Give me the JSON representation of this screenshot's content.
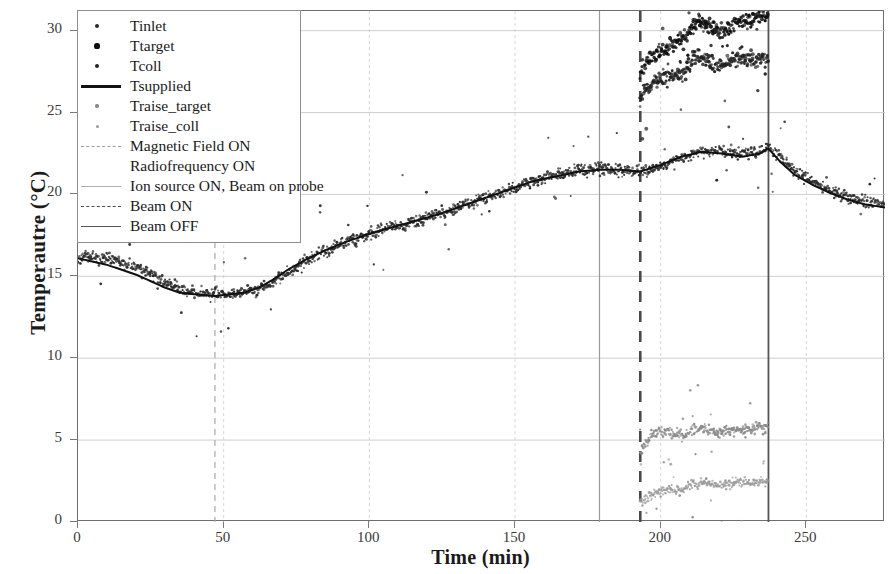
{
  "axes": {
    "ylabel": "Temperautre (°C)",
    "xlabel": "Time (min)",
    "yticks": [
      "0",
      "5",
      "10",
      "15",
      "20",
      "25",
      "30"
    ],
    "xticks": [
      "0",
      "50",
      "100",
      "150",
      "200",
      "250"
    ],
    "ylim": [
      0,
      31.2
    ],
    "xlim": [
      0,
      277
    ]
  },
  "legend": {
    "items": [
      {
        "label": "Tinlet",
        "key": "dot",
        "color": "#2b2b2b",
        "size": 2.6
      },
      {
        "label": "Ttarget",
        "key": "dot",
        "color": "#101010",
        "size": 3.4
      },
      {
        "label": "Tcoll",
        "key": "dot",
        "color": "#222222",
        "size": 3.0
      },
      {
        "label": "Tsupplied",
        "key": "solid-thick",
        "color": "#111111"
      },
      {
        "label": "Traise_target",
        "key": "dot",
        "color": "#8a8a8a",
        "size": 2.2
      },
      {
        "label": "Traise_coll",
        "key": "dot",
        "color": "#9a9a9a",
        "size": 2.0
      },
      {
        "label": "Magnetic Field ON",
        "key": "dash-light",
        "color": "#9e9e9e"
      },
      {
        "label": "Radiofrequency ON",
        "key": "none",
        "color": "#ffffff"
      },
      {
        "label": "Ion source ON, Beam on probe",
        "key": "solid-light",
        "color": "#b0b0b0"
      },
      {
        "label": "Beam ON",
        "key": "dash-dark",
        "color": "#4a4a4a"
      },
      {
        "label": "Beam OFF",
        "key": "solid-dark",
        "color": "#555555"
      }
    ]
  },
  "chart_data": {
    "type": "scatter",
    "title": "",
    "xlabel": "Time (min)",
    "ylabel": "Temperautre (°C)",
    "xlim": [
      0,
      277
    ],
    "ylim": [
      0,
      31.2
    ],
    "grid": true,
    "legend_position": "upper-left",
    "event_lines": [
      {
        "name": "Magnetic Field ON",
        "x": 47,
        "style": "dashed",
        "color": "#a8a8a8",
        "width": 1.2
      },
      {
        "name": "Ion source ON, Beam on probe",
        "x": 179,
        "style": "solid",
        "color": "#9a9a9a",
        "width": 1.2
      },
      {
        "name": "Beam ON",
        "x": 193,
        "style": "dashed",
        "color": "#4a4a4a",
        "width": 2.6
      },
      {
        "name": "Beam OFF",
        "x": 237,
        "style": "solid",
        "color": "#555555",
        "width": 1.8
      }
    ],
    "series": [
      {
        "name": "Tinlet",
        "type": "scatter",
        "color": "#2b2b2b",
        "marker_size": 2.4,
        "scatter_sigma": 0.3,
        "x": [
          0,
          5,
          10,
          15,
          20,
          25,
          30,
          35,
          40,
          47,
          52,
          57,
          62,
          67,
          72,
          78,
          85,
          92,
          100,
          108,
          116,
          124,
          132,
          140,
          148,
          156,
          164,
          172,
          179,
          186,
          193,
          200,
          207,
          214,
          221,
          228,
          234,
          237,
          241,
          246,
          252,
          258,
          264,
          270,
          277
        ],
        "y": [
          16.3,
          16.2,
          16.1,
          15.9,
          15.6,
          15.2,
          14.6,
          14.2,
          14.0,
          13.9,
          13.9,
          14.0,
          14.2,
          14.6,
          15.3,
          15.9,
          16.5,
          17.1,
          17.6,
          18.0,
          18.4,
          18.8,
          19.3,
          19.8,
          20.3,
          20.8,
          21.2,
          21.5,
          21.6,
          21.5,
          21.4,
          21.7,
          22.2,
          22.6,
          22.7,
          22.5,
          22.6,
          22.9,
          22.3,
          21.5,
          20.8,
          20.3,
          19.9,
          19.6,
          19.4
        ]
      },
      {
        "name": "Ttarget",
        "type": "scatter",
        "color": "#101010",
        "marker_size": 3.2,
        "scatter_sigma": 0.45,
        "x": [
          193,
          196,
          199,
          202,
          205,
          208,
          211,
          214,
          217,
          220,
          223,
          226,
          229,
          232,
          235,
          237
        ],
        "y": [
          27.4,
          28.2,
          28.7,
          29.0,
          29.3,
          29.5,
          30.3,
          30.6,
          30.2,
          29.9,
          30.1,
          30.4,
          30.6,
          30.7,
          30.8,
          30.9
        ]
      },
      {
        "name": "Tcoll",
        "type": "scatter",
        "color": "#222222",
        "marker_size": 3.2,
        "scatter_sigma": 0.42,
        "x": [
          193,
          196,
          199,
          202,
          205,
          208,
          211,
          214,
          217,
          220,
          223,
          226,
          229,
          232,
          235,
          237
        ],
        "y": [
          25.9,
          26.5,
          26.9,
          27.2,
          27.3,
          27.4,
          28.2,
          28.4,
          28.0,
          27.8,
          28.0,
          28.2,
          28.3,
          28.3,
          28.4,
          28.4
        ]
      },
      {
        "name": "Tsupplied",
        "type": "line",
        "color": "#111111",
        "line_width": 2.0,
        "x": [
          0,
          5,
          10,
          15,
          20,
          25,
          30,
          35,
          40,
          47,
          52,
          57,
          62,
          67,
          72,
          78,
          85,
          92,
          100,
          108,
          116,
          124,
          132,
          140,
          148,
          156,
          164,
          172,
          179,
          186,
          193,
          200,
          207,
          214,
          221,
          228,
          234,
          237,
          241,
          246,
          252,
          258,
          264,
          270,
          277
        ],
        "y": [
          16.1,
          15.9,
          15.7,
          15.4,
          15.1,
          14.7,
          14.3,
          14.0,
          13.9,
          13.8,
          13.9,
          14.0,
          14.3,
          14.8,
          15.4,
          16.0,
          16.6,
          17.1,
          17.6,
          18.0,
          18.4,
          18.8,
          19.3,
          19.8,
          20.3,
          20.8,
          21.1,
          21.4,
          21.5,
          21.5,
          21.4,
          21.8,
          22.3,
          22.6,
          22.5,
          22.3,
          22.5,
          22.8,
          22.0,
          21.2,
          20.6,
          20.1,
          19.7,
          19.4,
          19.2
        ]
      },
      {
        "name": "Traise_target",
        "type": "scatter",
        "color": "#8a8a8a",
        "marker_size": 2.4,
        "scatter_sigma": 0.3,
        "x": [
          193,
          196,
          199,
          202,
          205,
          208,
          211,
          214,
          217,
          220,
          223,
          226,
          229,
          232,
          235,
          237
        ],
        "y": [
          4.2,
          5.2,
          5.5,
          5.5,
          5.4,
          5.3,
          5.6,
          5.7,
          5.5,
          5.4,
          5.5,
          5.6,
          5.7,
          5.7,
          5.8,
          5.8
        ]
      },
      {
        "name": "Traise_coll",
        "type": "scatter",
        "color": "#9a9a9a",
        "marker_size": 2.2,
        "scatter_sigma": 0.26,
        "x": [
          193,
          196,
          199,
          202,
          205,
          208,
          211,
          214,
          217,
          220,
          223,
          226,
          229,
          232,
          235,
          237
        ],
        "y": [
          1.1,
          1.6,
          1.8,
          1.9,
          1.9,
          2.0,
          2.3,
          2.4,
          2.3,
          2.2,
          2.3,
          2.4,
          2.4,
          2.4,
          2.5,
          2.5
        ]
      }
    ]
  }
}
